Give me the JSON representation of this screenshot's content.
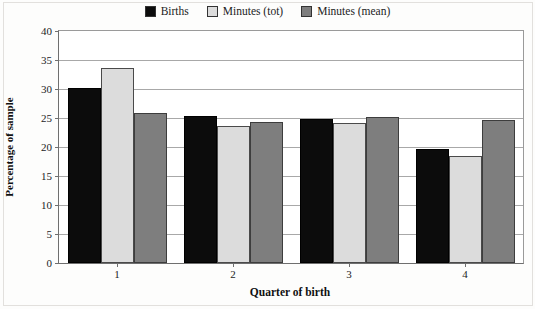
{
  "chart_data": {
    "type": "bar",
    "title": "",
    "xlabel": "Quarter of birth",
    "ylabel": "Percentage of sample",
    "categories": [
      "1",
      "2",
      "3",
      "4"
    ],
    "ylim": [
      0,
      40
    ],
    "yticks": [
      0,
      5,
      10,
      15,
      20,
      25,
      30,
      35,
      40
    ],
    "grid": true,
    "legend_position": "top-center",
    "series": [
      {
        "name": "Births",
        "color": "#0c0c0c",
        "values": [
          30.2,
          25.3,
          24.8,
          19.6
        ]
      },
      {
        "name": "Minutes (tot)",
        "color": "#dcdcdc",
        "values": [
          33.6,
          23.7,
          24.1,
          18.5
        ]
      },
      {
        "name": "Minutes (mean)",
        "color": "#7e7e7e",
        "values": [
          25.9,
          24.3,
          25.1,
          24.6
        ]
      }
    ]
  },
  "legend": {
    "items": [
      {
        "label": "Births"
      },
      {
        "label": "Minutes (tot)"
      },
      {
        "label": "Minutes (mean)"
      }
    ]
  },
  "axes": {
    "y_title": "Percentage of sample",
    "x_title": "Quarter of birth",
    "y_tick_labels": [
      "0",
      "5",
      "10",
      "15",
      "20",
      "25",
      "30",
      "35",
      "40"
    ],
    "x_tick_labels": [
      "1",
      "2",
      "3",
      "4"
    ]
  }
}
